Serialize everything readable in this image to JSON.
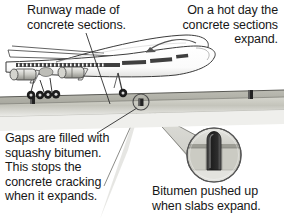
{
  "figure": {
    "background_color": "#ffffff"
  },
  "captions": {
    "runway_sections": "Runway made of\nconcrete sections.",
    "hot_day": "On a hot day the\nconcrete sections\nexpand.",
    "gaps_filled": "Gaps are filled with\nsquashy bitumen.\nThis stops the\nconcrete cracking\nwhen it expands.",
    "bitumen_pushed": "Bitumen pushed up\nwhen slabs expand."
  },
  "labels": {
    "airplane": "airliner",
    "runway": "concrete runway",
    "bitumen_gap": "bitumen filled gap",
    "magnifier": "magnified detail of expansion joint",
    "leader_runway": "leader line to runway slab",
    "leader_gap": "leader line to bitumen gap",
    "arrow_hot_day": "curved arrow to aircraft"
  },
  "colors": {
    "text": "#171717",
    "outline": "#333333",
    "runway_top": "#b9b9b1",
    "runway_face": "#cfcfc6",
    "runway_shadow": "#9d9d95",
    "bitumen": "#2b2b2b",
    "fuselage": "#ffffff",
    "stripe": "#4a4a4a",
    "wheel": "#1c1c1c",
    "cone": "#c9c9c2"
  }
}
